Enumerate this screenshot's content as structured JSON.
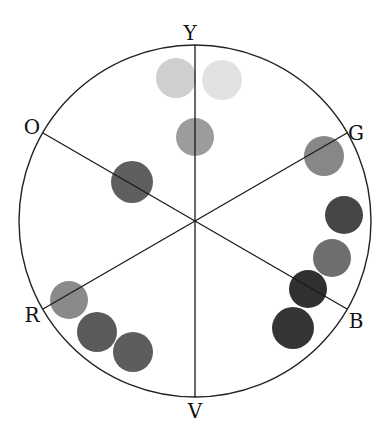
{
  "diagram": {
    "type": "color-wheel",
    "center": [
      195,
      221
    ],
    "radius": 176,
    "labels": [
      {
        "id": "Y",
        "text": "Y",
        "x": 190,
        "y": 40
      },
      {
        "id": "G",
        "text": "G",
        "x": 356,
        "y": 140
      },
      {
        "id": "B",
        "text": "B",
        "x": 356,
        "y": 328
      },
      {
        "id": "V",
        "text": "V",
        "x": 195,
        "y": 418
      },
      {
        "id": "R",
        "text": "R",
        "x": 32,
        "y": 322
      },
      {
        "id": "O",
        "text": "O",
        "x": 32,
        "y": 134
      }
    ],
    "spokes": [
      {
        "from": "Y",
        "to": "V",
        "x1": 195,
        "y1": 45,
        "x2": 195,
        "y2": 397
      },
      {
        "from": "O",
        "to": "B",
        "x1": 43,
        "y1": 133,
        "x2": 347,
        "y2": 309
      },
      {
        "from": "G",
        "to": "R",
        "x1": 347,
        "y1": 133,
        "x2": 43,
        "y2": 309
      }
    ],
    "swatches": [
      {
        "cx": 176,
        "cy": 78,
        "r": 20,
        "color": "#cfcfcf"
      },
      {
        "cx": 222,
        "cy": 80,
        "r": 20,
        "color": "#e2e2e2"
      },
      {
        "cx": 195,
        "cy": 137,
        "r": 19,
        "color": "#9c9c9c"
      },
      {
        "cx": 132,
        "cy": 182,
        "r": 21,
        "color": "#5f5f5f"
      },
      {
        "cx": 324,
        "cy": 156,
        "r": 20,
        "color": "#878787"
      },
      {
        "cx": 344,
        "cy": 215,
        "r": 19,
        "color": "#464646"
      },
      {
        "cx": 332,
        "cy": 258,
        "r": 19,
        "color": "#6e6e6e"
      },
      {
        "cx": 308,
        "cy": 289,
        "r": 19,
        "color": "#303030"
      },
      {
        "cx": 293,
        "cy": 328,
        "r": 21,
        "color": "#353535"
      },
      {
        "cx": 69,
        "cy": 300,
        "r": 19,
        "color": "#8a8a8a"
      },
      {
        "cx": 97,
        "cy": 332,
        "r": 20,
        "color": "#5a5a5a"
      },
      {
        "cx": 133,
        "cy": 352,
        "r": 20,
        "color": "#5d5d5d"
      }
    ]
  }
}
